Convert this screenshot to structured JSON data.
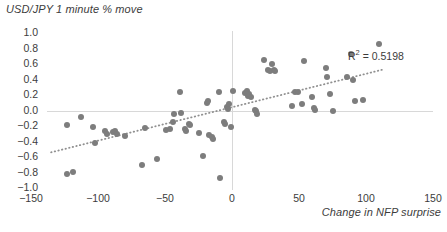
{
  "chart_data": {
    "type": "scatter",
    "title": "",
    "ylabel": "USD/JPY 1 minute % move",
    "xlabel": "Change in NFP surprise",
    "xlim": [
      -150,
      150
    ],
    "ylim": [
      -1.0,
      1.0
    ],
    "xticks": [
      "-150",
      "-100",
      "-50",
      "0",
      "50",
      "100",
      "150"
    ],
    "xtick_values": [
      -150,
      -100,
      -50,
      0,
      50,
      100,
      150
    ],
    "yticks": [
      "1.0",
      "0.8",
      "0.6",
      "0.4",
      "0.2",
      "0.0",
      "-0.2",
      "-0.4",
      "-0.6",
      "-0.8",
      "-1.0"
    ],
    "ytick_values": [
      1.0,
      0.8,
      0.6,
      0.4,
      0.2,
      0.0,
      -0.2,
      -0.4,
      -0.6,
      -0.8,
      -1.0
    ],
    "grid": false,
    "legend": "none",
    "annotations": [
      {
        "name": "r-squared",
        "text_prefix": "R",
        "text_sup": "2",
        "text_suffix": " = 0.5198",
        "value": 0.5198,
        "x": 103,
        "y": 0.71
      }
    ],
    "trendline": {
      "style": "dotted",
      "color": "#909090",
      "x_start": -135,
      "y_start": -0.54,
      "x_end": 113,
      "y_end": 0.53,
      "slope": 0.004315,
      "intercept": 0.0426
    },
    "marker": {
      "color": "#7d7d7d",
      "size_px": 6,
      "shape": "circle"
    },
    "points": [
      {
        "x": -123,
        "y": -0.19
      },
      {
        "x": -123,
        "y": -0.82
      },
      {
        "x": -119,
        "y": -0.79
      },
      {
        "x": -113,
        "y": -0.09
      },
      {
        "x": -104,
        "y": -0.21
      },
      {
        "x": -102,
        "y": -0.42
      },
      {
        "x": -95,
        "y": -0.27
      },
      {
        "x": -93,
        "y": -0.3
      },
      {
        "x": -89,
        "y": -0.28
      },
      {
        "x": -87,
        "y": -0.26
      },
      {
        "x": -86,
        "y": -0.3
      },
      {
        "x": -80,
        "y": -0.33
      },
      {
        "x": -67,
        "y": -0.7
      },
      {
        "x": -65,
        "y": -0.22
      },
      {
        "x": -56,
        "y": -0.63
      },
      {
        "x": -49,
        "y": -0.25
      },
      {
        "x": -46,
        "y": -0.24
      },
      {
        "x": -44,
        "y": -0.15
      },
      {
        "x": -43,
        "y": -0.05
      },
      {
        "x": -39,
        "y": 0.24
      },
      {
        "x": -38,
        "y": -0.03
      },
      {
        "x": -35,
        "y": -0.24
      },
      {
        "x": -34,
        "y": -0.27
      },
      {
        "x": -32,
        "y": -0.17
      },
      {
        "x": -31,
        "y": -0.19
      },
      {
        "x": -25,
        "y": -0.29
      },
      {
        "x": -22,
        "y": -0.59
      },
      {
        "x": -19,
        "y": 0.1
      },
      {
        "x": -18,
        "y": 0.12
      },
      {
        "x": -17,
        "y": -0.31
      },
      {
        "x": -15,
        "y": -0.34
      },
      {
        "x": -14,
        "y": -0.37
      },
      {
        "x": -10,
        "y": 0.24
      },
      {
        "x": -9,
        "y": -0.87
      },
      {
        "x": -6,
        "y": -0.15
      },
      {
        "x": -5,
        "y": -0.17
      },
      {
        "x": -4,
        "y": 0.05
      },
      {
        "x": -3,
        "y": 0.02
      },
      {
        "x": -2,
        "y": 0.09
      },
      {
        "x": -1,
        "y": -0.21
      },
      {
        "x": 1,
        "y": 0.25
      },
      {
        "x": 10,
        "y": 0.23
      },
      {
        "x": 11,
        "y": 0.25
      },
      {
        "x": 12,
        "y": 0.19
      },
      {
        "x": 13,
        "y": 0.21
      },
      {
        "x": 14,
        "y": 0.17
      },
      {
        "x": 17,
        "y": 0.01
      },
      {
        "x": 18,
        "y": 0.0
      },
      {
        "x": 19,
        "y": -0.05
      },
      {
        "x": 24,
        "y": 0.65
      },
      {
        "x": 27,
        "y": 0.52
      },
      {
        "x": 28,
        "y": 0.51
      },
      {
        "x": 30,
        "y": 0.6
      },
      {
        "x": 31,
        "y": 0.52
      },
      {
        "x": 32,
        "y": 0.51
      },
      {
        "x": 45,
        "y": 0.06
      },
      {
        "x": 47,
        "y": 0.24
      },
      {
        "x": 49,
        "y": 0.24
      },
      {
        "x": 52,
        "y": 0.09
      },
      {
        "x": 54,
        "y": 0.64
      },
      {
        "x": 60,
        "y": 0.18
      },
      {
        "x": 61,
        "y": 0.03
      },
      {
        "x": 62,
        "y": 0.01
      },
      {
        "x": 70,
        "y": 0.55
      },
      {
        "x": 71,
        "y": 0.43
      },
      {
        "x": 73,
        "y": 0.21
      },
      {
        "x": 75,
        "y": -0.01
      },
      {
        "x": 86,
        "y": 0.43
      },
      {
        "x": 89,
        "y": 0.73
      },
      {
        "x": 90,
        "y": 0.4
      },
      {
        "x": 92,
        "y": 0.12
      },
      {
        "x": 98,
        "y": 0.14
      },
      {
        "x": 110,
        "y": 0.86
      }
    ]
  }
}
